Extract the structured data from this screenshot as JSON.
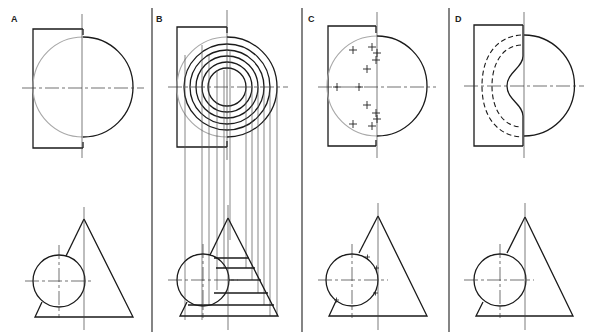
{
  "figure": {
    "panels": [
      {
        "id": "A",
        "label": "A",
        "description": "Half-circle front view overlapping rectangle; cone with sphere in plan view"
      },
      {
        "id": "B",
        "label": "B",
        "description": "Concentric cutting circles projected down to cone sections"
      },
      {
        "id": "C",
        "label": "C",
        "description": "Intersection points marked with crosses"
      },
      {
        "id": "D",
        "label": "D",
        "description": "Completed intersection curve with hidden (dashed) lines"
      }
    ],
    "colors": {
      "ink": "#1a1a1a",
      "construction": "#a8a8a8",
      "background": "#ffffff"
    }
  }
}
